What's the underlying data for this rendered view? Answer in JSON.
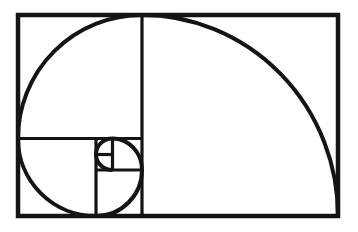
{
  "figure": {
    "name": "fibonacci-golden-spiral-diagram",
    "background_color": "#ffffff",
    "stroke_color": "#141414",
    "canvas": {
      "width": 358,
      "height": 232
    },
    "fibonacci_sequence": [
      1,
      1,
      2,
      3,
      5,
      8,
      13
    ],
    "frame": {
      "x": 18,
      "y": 15,
      "width": 320,
      "height": 201,
      "stroke_width": 4.5
    },
    "grid_stroke_width": 3.2,
    "grid_lines": [
      {
        "name": "divider-13-vs-8",
        "x1": 142,
        "y1": 15,
        "x2": 142,
        "y2": 216
      },
      {
        "name": "divider-8-vs-5",
        "x1": 18,
        "y1": 138.5,
        "x2": 142,
        "y2": 138.5
      },
      {
        "name": "divider-5-vs-3",
        "x1": 96,
        "y1": 138.5,
        "x2": 96,
        "y2": 216
      },
      {
        "name": "divider-3-vs-2",
        "x1": 96,
        "y1": 170,
        "x2": 142,
        "y2": 170
      },
      {
        "name": "divider-2-vs-1",
        "x1": 112.5,
        "y1": 138.5,
        "x2": 112.5,
        "y2": 170
      },
      {
        "name": "divider-1-vs-1",
        "x1": 96,
        "y1": 154.5,
        "x2": 112.5,
        "y2": 154.5
      }
    ],
    "spiral": {
      "stroke_width": 4,
      "start": {
        "x": 112.5,
        "y": 170
      },
      "arcs": [
        {
          "square": 1,
          "rx": 16.5,
          "ry": 15.5,
          "x": 96,
          "y": 154.5
        },
        {
          "square": 1,
          "rx": 16.5,
          "ry": 16,
          "x": 112.5,
          "y": 138.5
        },
        {
          "square": 2,
          "rx": 29.5,
          "ry": 31.5,
          "x": 142,
          "y": 170
        },
        {
          "square": 3,
          "rx": 46,
          "ry": 46,
          "x": 96,
          "y": 216
        },
        {
          "square": 5,
          "rx": 78,
          "ry": 77.5,
          "x": 18,
          "y": 138.5
        },
        {
          "square": 8,
          "rx": 124,
          "ry": 123.5,
          "x": 142,
          "y": 15
        },
        {
          "square": 13,
          "rx": 196,
          "ry": 201,
          "x": 338,
          "y": 216
        }
      ]
    }
  }
}
